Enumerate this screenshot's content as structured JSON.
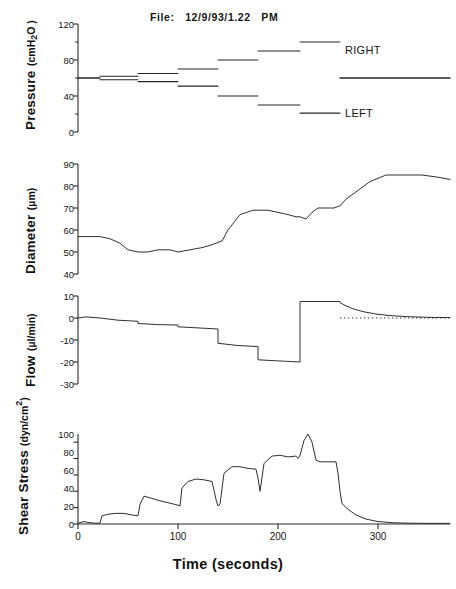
{
  "figure": {
    "file_title": "File:   12/9/93/1.22   PM",
    "x_axis_title": "Time (seconds)",
    "trace_labels": {
      "right": "RIGHT",
      "left": "LEFT"
    }
  },
  "chart_data": [
    {
      "type": "line",
      "title": "Pressure",
      "ylabel": "Pressure",
      "yunits": "(cmH2O)",
      "yunits_display": "(cmH₂O)",
      "xlabel": "Time (seconds)",
      "ylim": [
        0,
        120
      ],
      "yticks": [
        0,
        40,
        80,
        120
      ],
      "yticks_minor": [
        20,
        60,
        100
      ],
      "xlim": [
        0,
        372
      ],
      "xticks": [
        0,
        100,
        200,
        300
      ],
      "grid": false,
      "legend_position": "right-inline",
      "annotations": [
        "RIGHT",
        "LEFT"
      ],
      "series": [
        {
          "name": "RIGHT",
          "x": [
            0,
            22,
            22,
            60,
            60,
            100,
            100,
            140,
            140,
            180,
            180,
            222,
            222,
            262,
            262,
            372
          ],
          "values": [
            60,
            60,
            62,
            62,
            65,
            65,
            70,
            70,
            80,
            80,
            90,
            90,
            100,
            100,
            60,
            60
          ]
        },
        {
          "name": "LEFT",
          "x": [
            0,
            22,
            22,
            60,
            60,
            100,
            100,
            140,
            140,
            180,
            180,
            222,
            222,
            262,
            262,
            372
          ],
          "values": [
            60,
            60,
            58,
            58,
            56,
            56,
            51,
            51,
            40,
            40,
            30,
            30,
            21,
            21,
            60,
            60
          ]
        }
      ]
    },
    {
      "type": "line",
      "title": "Diameter",
      "ylabel": "Diameter",
      "yunits": "(µm)",
      "ylim": [
        40,
        90
      ],
      "yticks": [
        40,
        50,
        60,
        70,
        80,
        90
      ],
      "xlim": [
        0,
        372
      ],
      "xticks": [
        0,
        100,
        200,
        300
      ],
      "grid": false,
      "series": [
        {
          "name": "Diameter",
          "x": [
            0,
            10,
            22,
            32,
            42,
            50,
            60,
            70,
            80,
            92,
            100,
            112,
            124,
            132,
            138,
            144,
            150,
            162,
            175,
            182,
            190,
            200,
            210,
            218,
            222,
            228,
            234,
            240,
            248,
            256,
            262,
            268,
            280,
            292,
            308,
            326,
            344,
            360,
            372
          ],
          "values": [
            57,
            57,
            57,
            56,
            54,
            51,
            50,
            50,
            51,
            51,
            50,
            51,
            52,
            53,
            54,
            55,
            60,
            67,
            69,
            69,
            69,
            68,
            67,
            66,
            66,
            65,
            68,
            70,
            70,
            70,
            71,
            74,
            78,
            82,
            85,
            85,
            85,
            84,
            83
          ]
        }
      ]
    },
    {
      "type": "line",
      "title": "Flow",
      "ylabel": "Flow",
      "yunits": "(µl/min)",
      "ylim": [
        -30,
        10
      ],
      "yticks": [
        -30,
        -20,
        -10,
        0,
        10
      ],
      "xlim": [
        0,
        372
      ],
      "xticks": [
        0,
        100,
        200,
        300
      ],
      "grid": false,
      "zero_reference_line": true,
      "series": [
        {
          "name": "Flow",
          "x": [
            0,
            8,
            22,
            22,
            40,
            60,
            60,
            80,
            100,
            100,
            120,
            140,
            140,
            160,
            180,
            180,
            200,
            222,
            222,
            240,
            258,
            262,
            262,
            268,
            276,
            286,
            298,
            312,
            330,
            350,
            372
          ],
          "values": [
            0,
            0.5,
            0,
            0,
            -1,
            -1.5,
            -2.5,
            -3,
            -3.2,
            -4,
            -4.5,
            -5,
            -11.5,
            -12.5,
            -13,
            -19,
            -19.5,
            -20,
            7.5,
            7.5,
            7.5,
            7.5,
            7,
            5.5,
            4,
            2.8,
            1.8,
            1.1,
            0.6,
            0.3,
            0.2
          ]
        }
      ]
    },
    {
      "type": "line",
      "title": "Shear Stress",
      "ylabel": "Shear Stress",
      "yunits": "(dyn/cm2)",
      "yunits_display": "(dyn/cm²)",
      "ylim": [
        0,
        110
      ],
      "yticks": [
        0,
        20,
        40,
        60,
        80,
        100
      ],
      "xlim": [
        0,
        372
      ],
      "xticks": [
        0,
        100,
        200,
        300
      ],
      "grid": false,
      "series": [
        {
          "name": "Shear Stress",
          "x": [
            0,
            6,
            10,
            16,
            22,
            24,
            30,
            38,
            46,
            54,
            60,
            62,
            66,
            72,
            80,
            90,
            100,
            102,
            104,
            110,
            118,
            126,
            134,
            138,
            140,
            142,
            146,
            154,
            162,
            170,
            178,
            180,
            182,
            186,
            194,
            202,
            210,
            218,
            220,
            222,
            226,
            230,
            234,
            238,
            242,
            250,
            258,
            260,
            262,
            264,
            270,
            278,
            288,
            300,
            315,
            332,
            350,
            372
          ],
          "values": [
            1,
            3,
            2,
            1,
            1,
            10,
            12,
            13,
            13,
            11,
            10,
            24,
            34,
            32,
            29,
            26,
            23,
            22,
            44,
            52,
            55,
            54,
            52,
            30,
            22,
            24,
            62,
            70,
            70,
            68,
            67,
            56,
            40,
            74,
            83,
            84,
            82,
            83,
            80,
            84,
            102,
            110,
            100,
            78,
            76,
            76,
            76,
            62,
            40,
            25,
            18,
            11,
            6,
            3,
            1.5,
            1,
            0.8,
            0.8
          ]
        }
      ]
    }
  ]
}
